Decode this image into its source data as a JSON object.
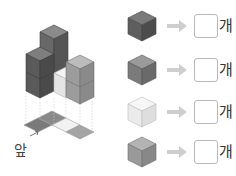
{
  "figure": {
    "front_label": "앞",
    "colors": {
      "dark": "#5f5f5f",
      "medium": "#7f7f7f",
      "light": "#a9a9a9",
      "white": "#ececec",
      "line": "#bfbfbf"
    }
  },
  "counts": [
    {
      "cube_color": "#5e5e5e",
      "shade": "dark",
      "answer": "",
      "unit": "개"
    },
    {
      "cube_color": "#7b7b7b",
      "shade": "medium",
      "answer": "",
      "unit": "개"
    },
    {
      "cube_color": "#e6e6e6",
      "shade": "white",
      "answer": "",
      "unit": "개"
    },
    {
      "cube_color": "#9a9a9a",
      "shade": "light",
      "answer": "",
      "unit": "개"
    }
  ]
}
